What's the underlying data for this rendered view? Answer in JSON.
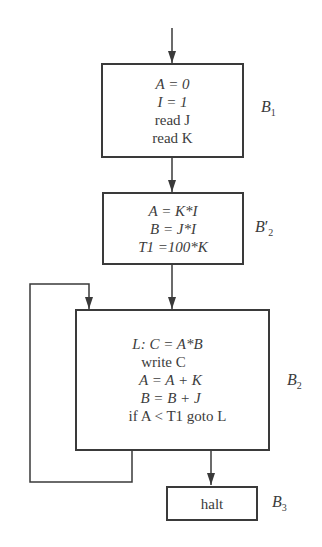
{
  "diagram": {
    "type": "flowchart",
    "title": "",
    "blocks": [
      {
        "id": "B1",
        "label": "B1",
        "label_main": "B",
        "label_sub": "1",
        "lines": [
          "A = 0",
          "I = 1",
          "read J",
          "read K"
        ]
      },
      {
        "id": "B2prime",
        "label": "B2′",
        "label_main": "B",
        "label_sub": "2",
        "label_prime": "′",
        "lines": [
          "A = K*I",
          "B = J*I",
          "T1 =100*K"
        ]
      },
      {
        "id": "B2",
        "label": "B2",
        "label_main": "B",
        "label_sub": "2",
        "lines": [
          "L: C = A*B",
          "write C",
          "A = A + K",
          "B = B + J",
          "if A < T1 goto L"
        ]
      },
      {
        "id": "B3",
        "label": "B3",
        "label_main": "B",
        "label_sub": "3",
        "lines": [
          "halt"
        ]
      }
    ],
    "edges": [
      {
        "from": "entry",
        "to": "B1"
      },
      {
        "from": "B1",
        "to": "B2prime"
      },
      {
        "from": "B2prime",
        "to": "B2"
      },
      {
        "from": "B2",
        "to": "B2",
        "type": "loop-back"
      },
      {
        "from": "B2",
        "to": "B3"
      }
    ],
    "line_color": "#3a3a3a"
  }
}
